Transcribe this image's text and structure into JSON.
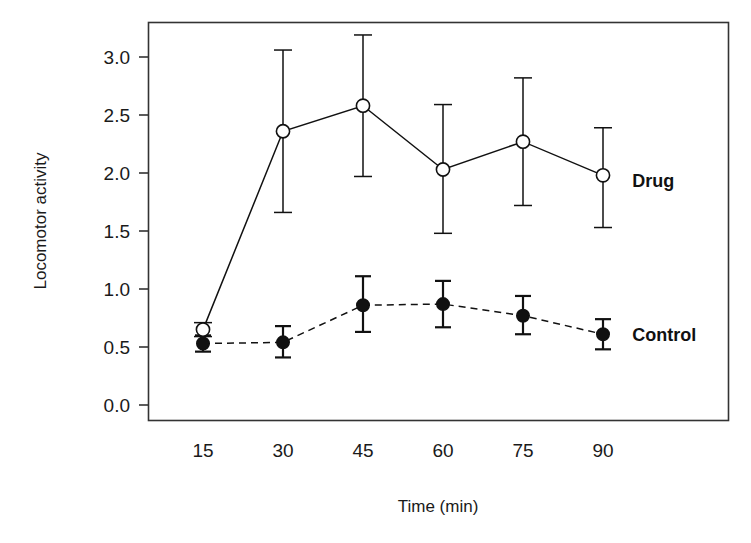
{
  "chart_data": {
    "type": "line",
    "title": "",
    "xlabel": "Time (min)",
    "ylabel": "Locomotor activity",
    "x": [
      15,
      30,
      45,
      60,
      75,
      90
    ],
    "xtick_labels": [
      "15",
      "30",
      "45",
      "60",
      "75",
      "90"
    ],
    "ytick_labels": [
      "0.0",
      "0.5",
      "1.0",
      "1.5",
      "2.0",
      "2.5",
      "3.0"
    ],
    "ytick_values": [
      0.0,
      0.5,
      1.0,
      1.5,
      2.0,
      2.5,
      3.0
    ],
    "ylim": [
      -0.13,
      3.15
    ],
    "xlim": [
      5,
      103
    ],
    "grid": false,
    "legend_position": "inline-right-of-series",
    "series": [
      {
        "name": "Drug",
        "marker": "open-circle",
        "linestyle": "solid",
        "color": "#111111",
        "values": [
          0.65,
          2.36,
          2.58,
          2.03,
          2.27,
          1.98
        ],
        "errors_upper": [
          0.06,
          0.7,
          0.61,
          0.56,
          0.55,
          0.41
        ],
        "errors_lower": [
          0.06,
          0.7,
          0.61,
          0.55,
          0.55,
          0.45
        ],
        "label_text": "Drug",
        "label_x": 95.5,
        "label_y": 1.93
      },
      {
        "name": "Control",
        "marker": "filled-circle",
        "linestyle": "dashed",
        "color": "#111111",
        "values": [
          0.53,
          0.54,
          0.86,
          0.87,
          0.77,
          0.61
        ],
        "errors_upper": [
          0.07,
          0.14,
          0.25,
          0.2,
          0.17,
          0.13
        ],
        "errors_lower": [
          0.07,
          0.13,
          0.23,
          0.2,
          0.16,
          0.13
        ],
        "label_text": "Control",
        "label_x": 95.5,
        "label_y": 0.6
      }
    ]
  },
  "axes": {
    "x_title": "Time (min)",
    "y_title": "Locomotor activity"
  },
  "labels": {
    "drug": "Drug",
    "control": "Control"
  }
}
